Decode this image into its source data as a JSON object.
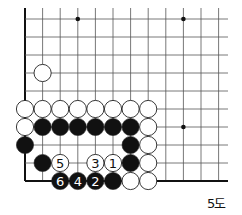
{
  "diagram": {
    "caption": "5도",
    "grid": {
      "x0": 25,
      "dx": 17.6,
      "y0": 19,
      "dy": 18,
      "cols": 12,
      "rows": 10,
      "line_top": 8,
      "line_right": 228,
      "left_edge": true,
      "bottom_edge": true
    },
    "star_points": [
      {
        "col": 3,
        "row": 0
      },
      {
        "col": 9,
        "row": 0
      },
      {
        "col": 9,
        "row": 6
      }
    ],
    "stones": [
      {
        "color": "white",
        "col": 1,
        "row": 3,
        "label": ""
      },
      {
        "color": "white",
        "col": 0,
        "row": 5,
        "label": ""
      },
      {
        "color": "white",
        "col": 1,
        "row": 5,
        "label": ""
      },
      {
        "color": "white",
        "col": 2,
        "row": 5,
        "label": ""
      },
      {
        "color": "white",
        "col": 3,
        "row": 5,
        "label": ""
      },
      {
        "color": "white",
        "col": 4,
        "row": 5,
        "label": ""
      },
      {
        "color": "white",
        "col": 5,
        "row": 5,
        "label": ""
      },
      {
        "color": "white",
        "col": 6,
        "row": 5,
        "label": ""
      },
      {
        "color": "white",
        "col": 7,
        "row": 5,
        "label": ""
      },
      {
        "color": "white",
        "col": 0,
        "row": 6,
        "label": ""
      },
      {
        "color": "black",
        "col": 1,
        "row": 6,
        "label": ""
      },
      {
        "color": "black",
        "col": 2,
        "row": 6,
        "label": ""
      },
      {
        "color": "black",
        "col": 3,
        "row": 6,
        "label": ""
      },
      {
        "color": "black",
        "col": 4,
        "row": 6,
        "label": ""
      },
      {
        "color": "black",
        "col": 5,
        "row": 6,
        "label": ""
      },
      {
        "color": "black",
        "col": 6,
        "row": 6,
        "label": ""
      },
      {
        "color": "white",
        "col": 7,
        "row": 6,
        "label": ""
      },
      {
        "color": "black",
        "col": 0,
        "row": 7,
        "label": ""
      },
      {
        "color": "black",
        "col": 6,
        "row": 7,
        "label": ""
      },
      {
        "color": "white",
        "col": 7,
        "row": 7,
        "label": ""
      },
      {
        "color": "black",
        "col": 1,
        "row": 8,
        "label": ""
      },
      {
        "color": "white",
        "col": 2,
        "row": 8,
        "label": "5"
      },
      {
        "color": "white",
        "col": 4,
        "row": 8,
        "label": "3"
      },
      {
        "color": "white",
        "col": 5,
        "row": 8,
        "label": "1"
      },
      {
        "color": "black",
        "col": 6,
        "row": 8,
        "label": ""
      },
      {
        "color": "white",
        "col": 7,
        "row": 8,
        "label": ""
      },
      {
        "color": "black",
        "col": 2,
        "row": 9,
        "label": "6"
      },
      {
        "color": "black",
        "col": 3,
        "row": 9,
        "label": "4"
      },
      {
        "color": "black",
        "col": 4,
        "row": 9,
        "label": "2"
      },
      {
        "color": "black",
        "col": 5,
        "row": 9,
        "label": ""
      },
      {
        "color": "white",
        "col": 6,
        "row": 9,
        "label": ""
      },
      {
        "color": "white",
        "col": 7,
        "row": 9,
        "label": ""
      }
    ],
    "colors": {
      "line": "#555555",
      "edge": "#111111",
      "black_stone": "#111111",
      "white_stone": "#ffffff",
      "stone_outline": "#222222"
    }
  }
}
